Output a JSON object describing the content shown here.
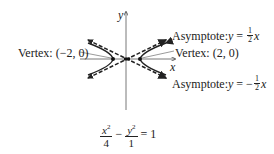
{
  "diagram": {
    "type": "hyperbola",
    "axes": {
      "x_label": "x",
      "y_label": "y"
    },
    "labels": {
      "vertex_left": "Vertex: (−2, 0)",
      "vertex_right": "Vertex: (2, 0)",
      "asymptote_pos_prefix": "Asymptote: ",
      "asymptote_pos_var": "y",
      "asymptote_pos_eq": " = ",
      "asymptote_pos_num": "1",
      "asymptote_pos_den": "2",
      "asymptote_pos_x": "x",
      "asymptote_neg_prefix": "Asymptote: ",
      "asymptote_neg_var": "y",
      "asymptote_neg_eq": " = −",
      "asymptote_neg_num": "1",
      "asymptote_neg_den": "2",
      "asymptote_neg_x": "x"
    },
    "equation": {
      "term1_num_base": "x",
      "term1_num_exp": "2",
      "term1_den": "4",
      "minus": " − ",
      "term2_num_base": "y",
      "term2_num_exp": "2",
      "term2_den": "1",
      "rhs": " = 1"
    },
    "colors": {
      "stroke": "#222222"
    }
  }
}
